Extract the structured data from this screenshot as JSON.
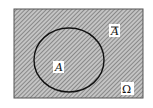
{
  "diagram": {
    "type": "venn",
    "universe": {
      "label": "Ω",
      "x": 14,
      "y": 9,
      "width": 129,
      "height": 89
    },
    "set": {
      "label": "A",
      "cx": 69,
      "cy": 60,
      "rx": 35,
      "ry": 32
    },
    "complement": {
      "label": "A"
    },
    "colors": {
      "border": "#555555",
      "circle": "#111111",
      "hatch_bg": "#b8b8b8",
      "hatch_line": "#6a6a6a",
      "label_bg": "#ffffff"
    }
  }
}
